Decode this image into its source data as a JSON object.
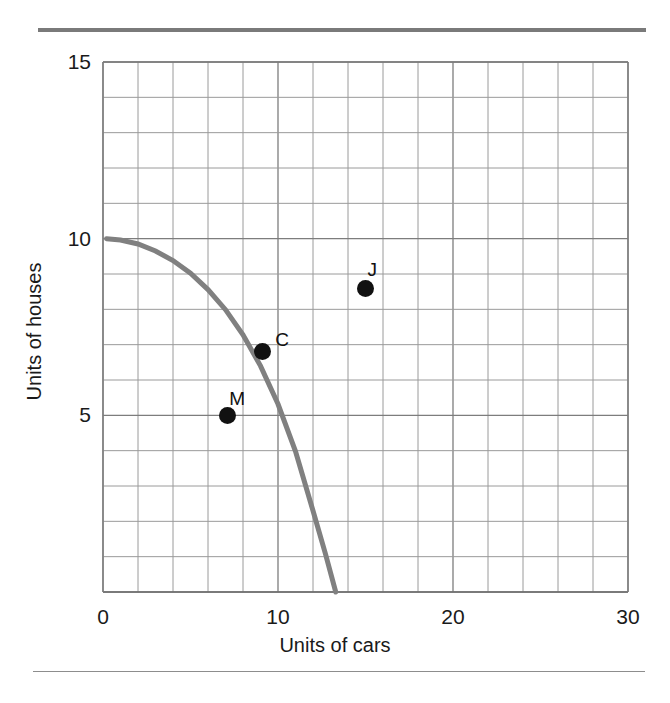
{
  "figure": {
    "top_rule_color": "#7a7a7a",
    "bottom_rule_color": "#8d8d8d",
    "background_color": "#ffffff"
  },
  "chart_data": {
    "type": "line",
    "title": "",
    "subtitle": "",
    "xlabel": "Units of cars",
    "ylabel": "Units of houses",
    "xlim": [
      0,
      30
    ],
    "ylim": [
      0,
      15
    ],
    "xticks": [
      0,
      10,
      20,
      30
    ],
    "xticklabels": [
      "0",
      "10",
      "20",
      "30"
    ],
    "yticks": [
      5,
      10,
      15
    ],
    "yticklabels": [
      "5",
      "10",
      "15"
    ],
    "grid": true,
    "grid_color": "#9a9a9a",
    "grid_minor_x_step": 2,
    "grid_minor_y_step": 1,
    "legend": null,
    "series": [
      {
        "name": "production-possibilities-frontier",
        "type": "line",
        "color": "#808080",
        "linewidth": 5,
        "x": [
          0.2,
          1.0,
          2.0,
          3.0,
          4.0,
          5.0,
          6.0,
          7.0,
          8.0,
          9.0,
          10.0,
          11.0,
          12.0,
          12.7,
          13.3
        ],
        "y": [
          10.0,
          9.96,
          9.85,
          9.65,
          9.38,
          9.02,
          8.56,
          7.99,
          7.28,
          6.4,
          5.32,
          3.98,
          2.3,
          1.1,
          0.0
        ]
      }
    ],
    "points": [
      {
        "label": "J",
        "x": 15.0,
        "y": 8.6,
        "color": "#111111",
        "label_dx": 2,
        "label_dy": -19
      },
      {
        "label": "C",
        "x": 9.1,
        "y": 6.8,
        "color": "#111111",
        "label_dx": 13,
        "label_dy": -13
      },
      {
        "label": "M",
        "x": 7.1,
        "y": 5.0,
        "color": "#111111",
        "label_dx": 2,
        "label_dy": -17
      }
    ],
    "annotations": []
  }
}
